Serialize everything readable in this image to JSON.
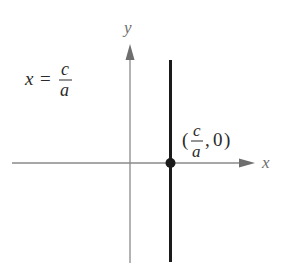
{
  "diagram": {
    "type": "coordinate-plane",
    "axes": {
      "x_label": "x",
      "y_label": "y",
      "axis_color": "#8a8a8a"
    },
    "line": {
      "description": "vertical line",
      "equation_lhs": "x",
      "equation_eq": "=",
      "equation_num": "c",
      "equation_den": "a",
      "color": "#1a1a1a"
    },
    "point": {
      "open_paren": "(",
      "x_num": "c",
      "x_den": "a",
      "separator": ",",
      "y_value": "0",
      "close_paren": ")",
      "color": "#1a1a1a"
    }
  }
}
